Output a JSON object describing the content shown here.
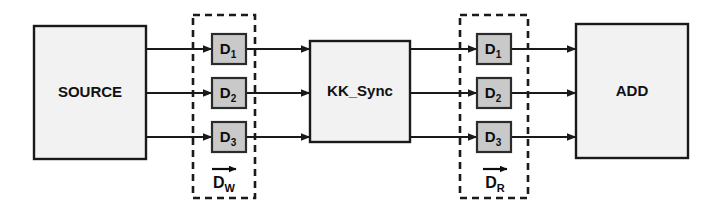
{
  "diagram": {
    "background_color": "#ffffff",
    "line_color": "#1a1a1a",
    "block_fill": "#f2f2f2",
    "block_stroke": "#1a1a1a",
    "register_fill": "#c9c9c9",
    "register_stroke": "#2b2b2b",
    "dashed_stroke": "#1a1a1a"
  },
  "blocks": [
    {
      "id": "source",
      "label": "SOURCE",
      "x": 34,
      "y": 26,
      "width": 112,
      "height": 133
    },
    {
      "id": "kk_sync",
      "label": "KK_Sync",
      "x": 310,
      "y": 41,
      "width": 100,
      "height": 101
    },
    {
      "id": "add",
      "label": "ADD",
      "x": 576,
      "y": 24,
      "width": 112,
      "height": 134
    }
  ],
  "register_groups": [
    {
      "id": "write_bank",
      "vector_label_base": "D",
      "vector_label_sub": "W",
      "vector_has_arrow": true,
      "dash_box": {
        "x": 193,
        "y": 15,
        "width": 62,
        "height": 183
      },
      "vector_label_x": 224,
      "vector_label_y": 180,
      "registers": [
        {
          "id": "dw1",
          "base": "D",
          "sub": "1",
          "x": 212,
          "y": 34,
          "width": 34,
          "height": 30
        },
        {
          "id": "dw2",
          "base": "D",
          "sub": "2",
          "x": 212,
          "y": 78,
          "width": 34,
          "height": 30
        },
        {
          "id": "dw3",
          "base": "D",
          "sub": "3",
          "x": 212,
          "y": 122,
          "width": 34,
          "height": 30
        }
      ]
    },
    {
      "id": "read_bank",
      "vector_label_base": "D",
      "vector_label_sub": "R",
      "vector_has_arrow": true,
      "dash_box": {
        "x": 460,
        "y": 15,
        "width": 68,
        "height": 183
      },
      "vector_label_x": 495,
      "vector_label_y": 180,
      "registers": [
        {
          "id": "dr1",
          "base": "D",
          "sub": "1",
          "x": 477,
          "y": 34,
          "width": 34,
          "height": 30
        },
        {
          "id": "dr2",
          "base": "D",
          "sub": "2",
          "x": 477,
          "y": 78,
          "width": 34,
          "height": 30
        },
        {
          "id": "dr3",
          "base": "D",
          "sub": "3",
          "x": 477,
          "y": 122,
          "width": 34,
          "height": 30
        }
      ]
    }
  ],
  "signal_rows": [
    {
      "id": "row1",
      "y": 49
    },
    {
      "id": "row2",
      "y": 93
    },
    {
      "id": "row3",
      "y": 137
    }
  ],
  "connections": [
    {
      "id": "source-to-dw1",
      "from": "source",
      "to": "dw1",
      "x1": 146,
      "x2": 212,
      "y": 49,
      "arrow": true
    },
    {
      "id": "source-to-dw2",
      "from": "source",
      "to": "dw2",
      "x1": 146,
      "x2": 212,
      "y": 93,
      "arrow": true
    },
    {
      "id": "source-to-dw3",
      "from": "source",
      "to": "dw3",
      "x1": 146,
      "x2": 212,
      "y": 137,
      "arrow": true
    },
    {
      "id": "dw1-to-kk",
      "from": "dw1",
      "to": "kk_sync",
      "x1": 246,
      "x2": 310,
      "y": 49,
      "arrow": true
    },
    {
      "id": "dw2-to-kk",
      "from": "dw2",
      "to": "kk_sync",
      "x1": 246,
      "x2": 310,
      "y": 93,
      "arrow": true
    },
    {
      "id": "dw3-to-kk",
      "from": "dw3",
      "to": "kk_sync",
      "x1": 246,
      "x2": 310,
      "y": 137,
      "arrow": true
    },
    {
      "id": "kk-to-dr1",
      "from": "kk_sync",
      "to": "dr1",
      "x1": 410,
      "x2": 477,
      "y": 49,
      "arrow": true
    },
    {
      "id": "kk-to-dr2",
      "from": "kk_sync",
      "to": "dr2",
      "x1": 410,
      "x2": 477,
      "y": 93,
      "arrow": true
    },
    {
      "id": "kk-to-dr3",
      "from": "kk_sync",
      "to": "dr3",
      "x1": 410,
      "x2": 477,
      "y": 137,
      "arrow": true
    },
    {
      "id": "dr1-to-add",
      "from": "dr1",
      "to": "add",
      "x1": 511,
      "x2": 576,
      "y": 49,
      "arrow": true
    },
    {
      "id": "dr2-to-add",
      "from": "dr2",
      "to": "add",
      "x1": 511,
      "x2": 576,
      "y": 93,
      "arrow": true
    },
    {
      "id": "dr3-to-add",
      "from": "dr3",
      "to": "add",
      "x1": 511,
      "x2": 576,
      "y": 137,
      "arrow": true
    }
  ]
}
